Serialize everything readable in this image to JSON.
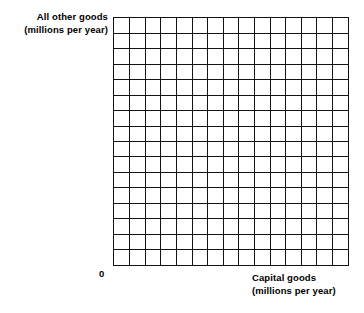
{
  "figure": {
    "kind": "blank-graph-worksheet",
    "background_color": "#ffffff",
    "line_color": "#111111"
  },
  "axes": {
    "y_axis": {
      "label_line1": "All other goods",
      "label_line2": "(millions per year)"
    },
    "x_axis": {
      "label_line1": "Capital goods",
      "label_line2": "(millions per year)"
    },
    "origin_label": "0"
  },
  "chart_data": {
    "type": "line",
    "title": "",
    "subtitle": "",
    "xlabel": "Capital goods (millions per year)",
    "ylabel": "All other goods (millions per year)",
    "xlim": [
      0,
      15
    ],
    "ylim": [
      0,
      16
    ],
    "grid": true,
    "grid_columns": 15,
    "grid_rows": 16,
    "x_tick_labels": [
      "0"
    ],
    "y_tick_labels": [],
    "legend": [],
    "legend_position": "none",
    "annotations": [],
    "series": [],
    "x": [],
    "values": [],
    "note": "Empty graph paper grid; no data series are plotted."
  }
}
